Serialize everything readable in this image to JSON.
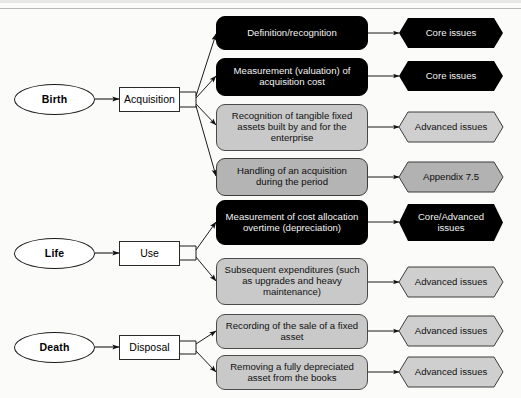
{
  "diagram": {
    "stages": [
      {
        "id": "birth",
        "phase_label": "Birth",
        "activity_label": "Acquisition",
        "topics": [
          {
            "text": "Definition/recognition",
            "style": "black",
            "classification": {
              "text": "Core issues",
              "style": "black"
            }
          },
          {
            "text": "Measurement (valuation) of acquisition cost",
            "style": "black",
            "classification": {
              "text": "Core issues",
              "style": "black"
            }
          },
          {
            "text": "Recognition of tangible fixed assets built by and for the enterprise",
            "style": "gray",
            "classification": {
              "text": "Advanced issues",
              "style": "gray"
            }
          },
          {
            "text": "Handling of an acquisition during the period",
            "style": "gray-dark",
            "classification": {
              "text": "Appendix 7.5",
              "style": "gray-dark"
            }
          }
        ]
      },
      {
        "id": "life",
        "phase_label": "Life",
        "activity_label": "Use",
        "topics": [
          {
            "text": "Measurement of cost allocation overtime (depreciation)",
            "style": "black",
            "classification": {
              "text": "Core/Advanced issues",
              "style": "black"
            }
          },
          {
            "text": "Subsequent expenditures (such as upgrades and heavy maintenance)",
            "style": "gray",
            "classification": {
              "text": "Advanced issues",
              "style": "gray"
            }
          }
        ]
      },
      {
        "id": "death",
        "phase_label": "Death",
        "activity_label": "Disposal",
        "topics": [
          {
            "text": "Recording of the sale of a fixed asset",
            "style": "gray",
            "classification": {
              "text": "Advanced issues",
              "style": "gray"
            }
          },
          {
            "text": "Removing a fully depreciated asset from the books",
            "style": "gray",
            "classification": {
              "text": "Advanced issues",
              "style": "gray"
            }
          }
        ]
      }
    ],
    "colors": {
      "black_fill": "#000000",
      "gray_fill": "#c9c9c9",
      "gray_dark_fill": "#b4b4b4",
      "octagon_gray_fill": "#cfcfcf",
      "line": "#1b1b1b",
      "background": "#fbfbfa"
    }
  }
}
